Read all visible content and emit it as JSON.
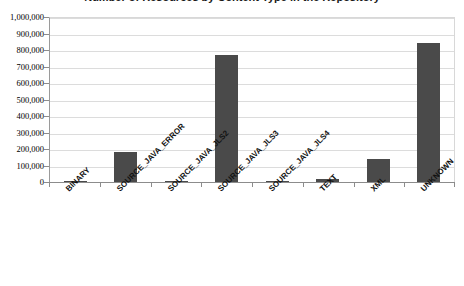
{
  "chart_data": {
    "type": "bar",
    "title": "Number of Resources by Content Type in the Repository",
    "xlabel": "",
    "ylabel": "",
    "categories": [
      "BINARY",
      "SOURCE_JAVA_ERROR",
      "SOURCE_JAVA_JLS2",
      "SOURCE_JAVA_JLS3",
      "SOURCE_JAVA_JLS4",
      "TEXT",
      "XML",
      "UNKNOWN"
    ],
    "values": [
      2000,
      180000,
      2000,
      770000,
      8000,
      20000,
      140000,
      840000
    ],
    "ylim": [
      0,
      1000000
    ],
    "ytick_values": [
      0,
      100000,
      200000,
      300000,
      400000,
      500000,
      600000,
      700000,
      800000,
      900000,
      1000000
    ],
    "ytick_labels": [
      "0",
      "100,000",
      "200,000",
      "300,000",
      "400,000",
      "500,000",
      "600,000",
      "700,000",
      "800,000",
      "900,000",
      "1,000,000"
    ],
    "grid": true,
    "legend": false,
    "legend_position": "none",
    "bar_color": "#4a4a4a",
    "gridline_color": "#dcdcdc",
    "axis_color": "#8c8c8c",
    "background_color": "#ffffff"
  }
}
